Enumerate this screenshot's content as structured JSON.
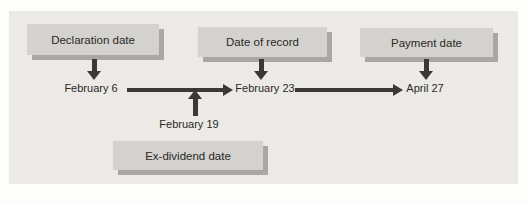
{
  "figure": {
    "boxes": {
      "declaration": {
        "label": "Declaration date"
      },
      "record": {
        "label": "Date of record"
      },
      "payment": {
        "label": "Payment date"
      },
      "ex_dividend": {
        "label": "Ex-dividend date"
      }
    },
    "dates": {
      "declaration": "February 6",
      "record": "February 23",
      "payment": "April 27",
      "ex_dividend": "February 19"
    },
    "colors": {
      "panel_bg": "#ebeae7",
      "box_fill": "#d3d2ce",
      "box_shadow": "#a8a7a4",
      "arrow": "#3b3835",
      "text": "#2b2823"
    }
  }
}
